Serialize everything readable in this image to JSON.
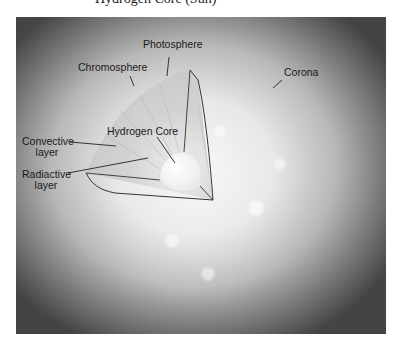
{
  "title_fragment": "Hydrogen Core (Sun)",
  "figure": {
    "labels": {
      "photosphere": "Photosphere",
      "chromosphere": "Chromosphere",
      "corona": "Corona",
      "hydrogen_core": "Hydrogen Core",
      "convective_layer_1": "Convective",
      "convective_layer_2": "layer",
      "radiative_layer_1": "Radiactive",
      "radiative_layer_2": "layer"
    },
    "colors": {
      "panel_center": "#f4f4f4",
      "panel_edge": "#444444",
      "outline": "#333333",
      "core": "#fbfbfb"
    }
  }
}
